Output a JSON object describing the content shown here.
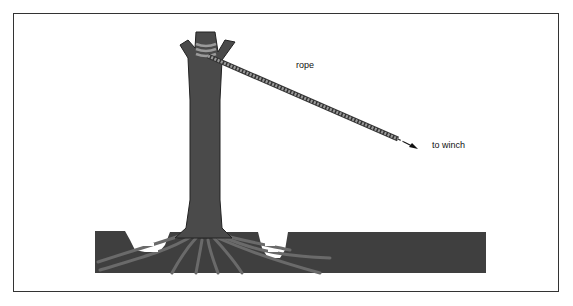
{
  "diagram": {
    "labels": {
      "rope": "rope",
      "winch": "to winch"
    },
    "colors": {
      "trunk": "#4a4a4a",
      "soil": "#3f3f3f",
      "rope": "#8a8a8a",
      "frame": "#333333"
    }
  }
}
